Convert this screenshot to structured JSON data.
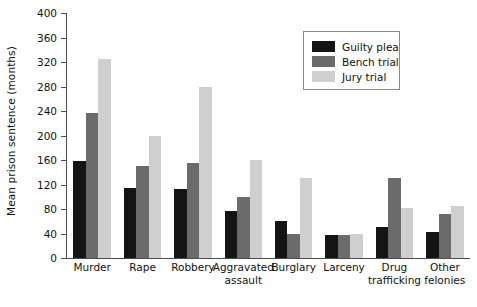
{
  "chart_data": {
    "type": "bar",
    "title": "",
    "subtitle": "",
    "xlabel": "",
    "ylabel": "Mean prison sentence (months)",
    "ylim": [
      0,
      400
    ],
    "yticks": [
      0,
      40,
      80,
      120,
      160,
      200,
      240,
      280,
      320,
      360,
      400
    ],
    "grid": false,
    "legend_position": "top-right",
    "categories": [
      "Murder",
      "Rape",
      "Robbery",
      "Aggravated assault",
      "Burglary",
      "Larceny",
      "Drug trafficking",
      "Other felonies"
    ],
    "category_lines": [
      [
        "Murder"
      ],
      [
        "Rape"
      ],
      [
        "Robbery"
      ],
      [
        "Aggravated",
        "assault"
      ],
      [
        "Burglary"
      ],
      [
        "Larceny"
      ],
      [
        "Drug",
        "trafficking"
      ],
      [
        "Other",
        "felonies"
      ]
    ],
    "series": [
      {
        "name": "Guilty plea",
        "color": "#141414",
        "values": [
          158,
          115,
          112,
          77,
          60,
          37,
          50,
          43
        ]
      },
      {
        "name": "Bench trial",
        "color": "#6b6b6b",
        "values": [
          236,
          151,
          155,
          100,
          40,
          38,
          131,
          72
        ]
      },
      {
        "name": "Jury trial",
        "color": "#cfcfcf",
        "values": [
          325,
          200,
          280,
          160,
          130,
          39,
          82,
          85
        ]
      }
    ]
  },
  "legend": {
    "items": [
      {
        "label": "Guilty plea",
        "color": "#141414"
      },
      {
        "label": "Bench trial",
        "color": "#6b6b6b"
      },
      {
        "label": "Jury trial",
        "color": "#cfcfcf"
      }
    ]
  },
  "axis": {
    "y_title": "Mean prison sentence (months)",
    "y_tick_labels": [
      "400",
      "360",
      "320",
      "280",
      "240",
      "200",
      "160",
      "120",
      "80",
      "40",
      "0"
    ]
  }
}
